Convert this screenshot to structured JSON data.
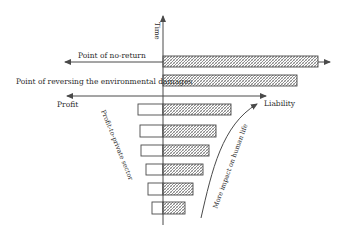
{
  "labels": {
    "time": "Time",
    "point_of_no_return": "Point of no-return",
    "point_of_reversing": "Point of reversing the environmental damages",
    "profit": "Profit",
    "liability": "Liability",
    "profit_to_private_sector": "Profit-to-private sector",
    "more_impact": "More impact on human life"
  },
  "colors": {
    "line": "#4a4a4a",
    "hatch": "#7a7a7a",
    "bar_fill": "#ffffff"
  },
  "bars": [
    {
      "y": 56,
      "h": 11,
      "left": 163,
      "right": 318,
      "profit_box": false
    },
    {
      "y": 75,
      "h": 11,
      "left": 163,
      "right": 297,
      "profit_box": false
    },
    {
      "y": 104,
      "h": 11,
      "left": 138,
      "right": 231,
      "profit_box": true
    },
    {
      "y": 125,
      "h": 12,
      "left": 140,
      "right": 216,
      "profit_box": true
    },
    {
      "y": 145,
      "h": 11,
      "left": 141,
      "right": 209,
      "profit_box": true
    },
    {
      "y": 164,
      "h": 11,
      "left": 146,
      "right": 203,
      "profit_box": true
    },
    {
      "y": 183,
      "h": 12,
      "left": 148,
      "right": 193,
      "profit_box": true
    },
    {
      "y": 202,
      "h": 12,
      "left": 152,
      "right": 185,
      "profit_box": true
    }
  ]
}
